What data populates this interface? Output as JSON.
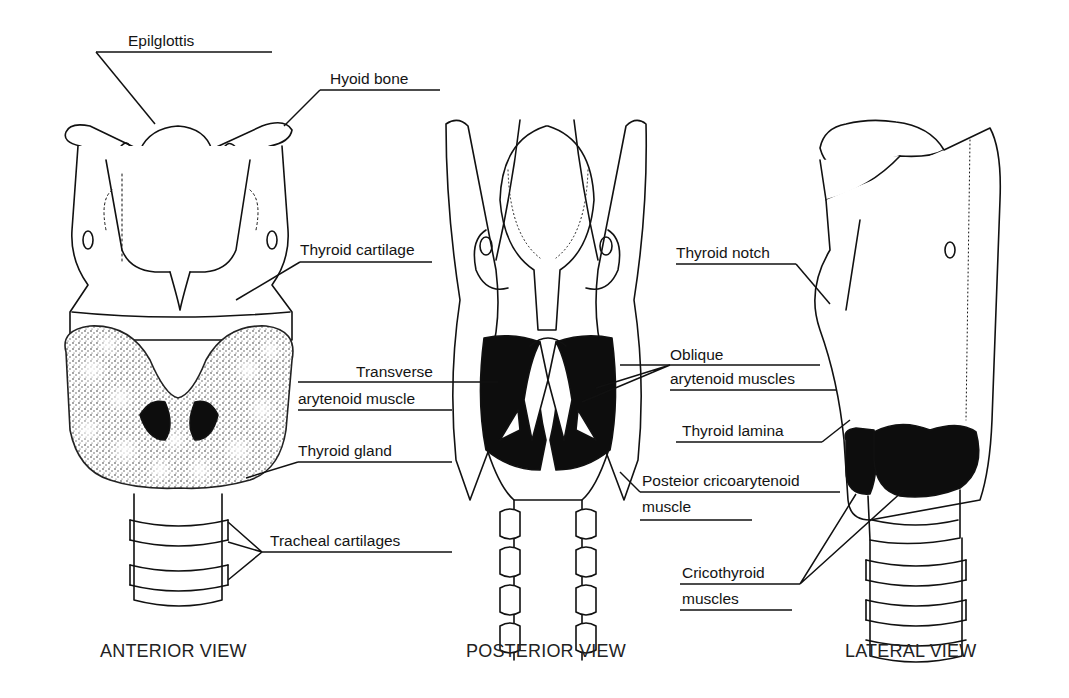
{
  "diagram": {
    "views": [
      {
        "id": "anterior",
        "caption": "ANTERIOR VIEW"
      },
      {
        "id": "posterior",
        "caption": "POSTERIOR VIEW"
      },
      {
        "id": "lateral",
        "caption": "LATERAL VIEW"
      }
    ],
    "labels": {
      "epiglottis": "Epilglottis",
      "hyoid_bone": "Hyoid bone",
      "thyroid_cartilage": "Thyroid cartilage",
      "transverse_line1": "Transverse",
      "transverse_line2": "arytenoid muscle",
      "thyroid_gland": "Thyroid gland",
      "tracheal_cartilages": "Tracheal cartilages",
      "oblique_line1": "Oblique",
      "oblique_line2": "arytenoid muscles",
      "posterior_crico_line1": "Posteior cricoarytenoid",
      "posterior_crico_line2": "muscle",
      "thyroid_notch": "Thyroid notch",
      "thyroid_lamina": "Thyroid lamina",
      "cricothyroid_line1": "Cricothyroid",
      "cricothyroid_line2": "muscles"
    },
    "colors": {
      "ink": "#111111",
      "background": "#ffffff",
      "muscle_fill": "#0d0d0d",
      "gland_stipple": "#555555"
    }
  }
}
